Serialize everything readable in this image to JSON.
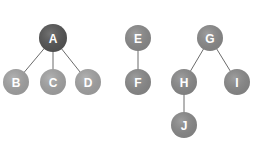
{
  "diagram": {
    "type": "forest",
    "colors": {
      "root_dark": "#555555",
      "node": "#8c8c8c",
      "node_light": "#a6a6a6",
      "edge": "#6b6b6b",
      "label": "#ffffff"
    },
    "nodes": [
      {
        "id": "A",
        "label": "A",
        "x": 53,
        "y": 38,
        "r": 14,
        "fill": "#545454"
      },
      {
        "id": "B",
        "label": "B",
        "x": 16,
        "y": 82,
        "r": 13,
        "fill": "#a3a3a3"
      },
      {
        "id": "C",
        "label": "C",
        "x": 53,
        "y": 82,
        "r": 13,
        "fill": "#a3a3a3"
      },
      {
        "id": "D",
        "label": "D",
        "x": 88,
        "y": 82,
        "r": 13,
        "fill": "#a3a3a3"
      },
      {
        "id": "E",
        "label": "E",
        "x": 138,
        "y": 38,
        "r": 13,
        "fill": "#8a8a8a"
      },
      {
        "id": "F",
        "label": "F",
        "x": 138,
        "y": 82,
        "r": 13,
        "fill": "#8a8a8a"
      },
      {
        "id": "G",
        "label": "G",
        "x": 210,
        "y": 38,
        "r": 13,
        "fill": "#8a8a8a"
      },
      {
        "id": "H",
        "label": "H",
        "x": 184,
        "y": 82,
        "r": 13,
        "fill": "#8a8a8a"
      },
      {
        "id": "I",
        "label": "I",
        "x": 237,
        "y": 82,
        "r": 13,
        "fill": "#8a8a8a"
      },
      {
        "id": "J",
        "label": "J",
        "x": 184,
        "y": 125,
        "r": 13,
        "fill": "#8a8a8a"
      }
    ],
    "edges": [
      {
        "from": "A",
        "to": "B"
      },
      {
        "from": "A",
        "to": "C"
      },
      {
        "from": "A",
        "to": "D"
      },
      {
        "from": "E",
        "to": "F"
      },
      {
        "from": "G",
        "to": "H"
      },
      {
        "from": "G",
        "to": "I"
      },
      {
        "from": "H",
        "to": "J"
      }
    ]
  }
}
